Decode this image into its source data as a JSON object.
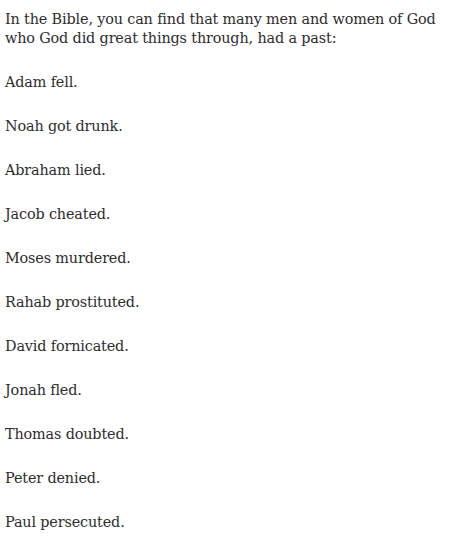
{
  "document": {
    "background_color": "#ffffff",
    "text_color": "#2d2d2d",
    "intro": "In the Bible, you can find that many men and women of God who God did great things through, had a past:",
    "items": [
      "Adam fell.",
      "Noah got drunk.",
      "Abraham lied.",
      "Jacob cheated.",
      "Moses murdered.",
      "Rahab prostituted.",
      "David fornicated.",
      "Jonah fled.",
      "Thomas doubted.",
      "Peter denied.",
      "Paul persecuted."
    ]
  }
}
